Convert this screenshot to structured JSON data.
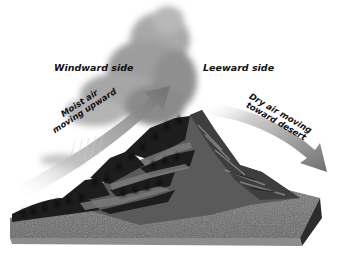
{
  "diagram": {
    "topic": "Rain shadow effect",
    "labels": {
      "windward": "Windward side",
      "leeward": "Leeward side",
      "moist_air_line1": "Moist air",
      "moist_air_line2": "moving upward",
      "dry_air_line1": "Dry air moving",
      "dry_air_line2": "toward desert"
    },
    "colors": {
      "cloud": "#9a9a9a",
      "arrow": "#7a7a7a",
      "trees": "#1e1e1e",
      "ground": "#6e6e6e",
      "mountain_rock": "#4a4a4a"
    }
  }
}
